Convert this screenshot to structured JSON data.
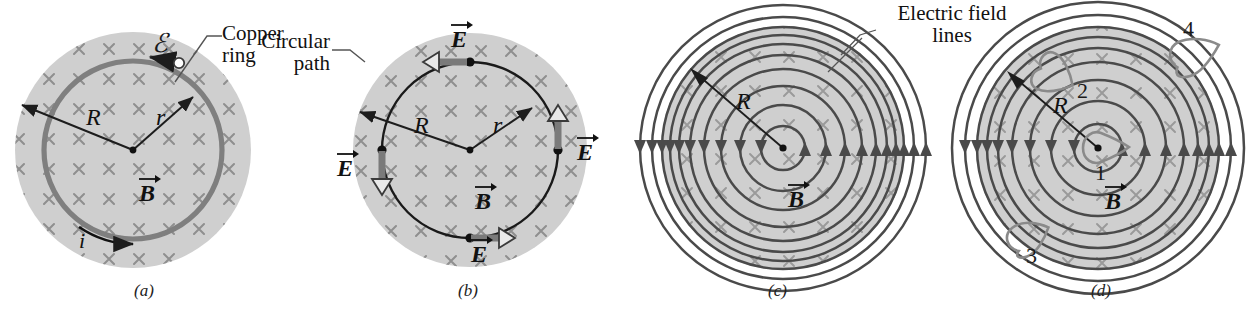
{
  "figure": {
    "background_color": "#ffffff",
    "disk_fill": "#cfcfcf",
    "cross_color": "#8c8c8c",
    "line_color": "#3b3b3b",
    "ring_color": "#808080",
    "loop_color": "#8a8a8a"
  },
  "callouts": [
    {
      "id": "copper-ring",
      "text": "Copper\nring"
    },
    {
      "id": "circular-path",
      "text": "Circular\npath"
    },
    {
      "id": "electric-field-lines",
      "text": "Electric field\nlines"
    }
  ],
  "panels": [
    {
      "id": "a",
      "letter": "(a)",
      "caption_label": "Copper ring in a uniform magnetic field into the page",
      "field_symbol": "×",
      "field_direction": "into-page",
      "labels": [
        {
          "id": "radius-R",
          "text": "R"
        },
        {
          "id": "radius-r",
          "text": "r"
        },
        {
          "id": "field-B",
          "text": "B",
          "vector": true
        },
        {
          "id": "current-i",
          "text": "i",
          "vector": false
        },
        {
          "id": "emf",
          "text": "ℰ",
          "vector": false
        }
      ],
      "elements": [
        "shaded-disk",
        "copper-ring",
        "radius-arrow-R",
        "radius-arrow-r",
        "current-arrow",
        "emf-marker"
      ]
    },
    {
      "id": "b",
      "letter": "(b)",
      "caption_label": "Circular Amperian path with tangential induced E vectors",
      "field_symbol": "×",
      "field_direction": "into-page",
      "labels": [
        {
          "id": "radius-R",
          "text": "R"
        },
        {
          "id": "radius-r",
          "text": "r"
        },
        {
          "id": "field-B",
          "text": "B",
          "vector": true
        }
      ],
      "e_vectors": [
        {
          "id": "E-top",
          "text": "E",
          "vector": true,
          "points": "left"
        },
        {
          "id": "E-right",
          "text": "E",
          "vector": true,
          "points": "up"
        },
        {
          "id": "E-bottom",
          "text": "E",
          "vector": true,
          "points": "right"
        },
        {
          "id": "E-left",
          "text": "E",
          "vector": true,
          "points": "down"
        }
      ],
      "elements": [
        "shaded-disk",
        "circular-path",
        "radius-arrow-R",
        "radius-arrow-r",
        "field-point-dots"
      ]
    },
    {
      "id": "c",
      "letter": "(c)",
      "caption_label": "Concentric electric field lines circling the changing B field",
      "field_symbol": "×",
      "field_direction": "into-page",
      "labels": [
        {
          "id": "radius-R",
          "text": "R"
        },
        {
          "id": "field-B",
          "text": "B",
          "vector": true
        }
      ],
      "field_line_count": 10,
      "circulation": "counterclockwise",
      "elements": [
        "shaded-disk",
        "field-line-circles",
        "radius-arrow-R",
        "center-dot",
        "arrowheads"
      ]
    },
    {
      "id": "d",
      "letter": "(d)",
      "caption_label": "Four numbered closed paths used to evaluate the line integral of E",
      "field_symbol": "×",
      "field_direction": "into-page",
      "labels": [
        {
          "id": "radius-R",
          "text": "R"
        },
        {
          "id": "field-B",
          "text": "B",
          "vector": true
        }
      ],
      "field_line_count": 8,
      "circulation": "counterclockwise",
      "numbered_paths": [
        {
          "id": "path-1",
          "number": "1",
          "location": "center"
        },
        {
          "id": "path-2",
          "number": "2",
          "location": "upper-left inside disk"
        },
        {
          "id": "path-3",
          "number": "3",
          "location": "lower-left on disk edge"
        },
        {
          "id": "path-4",
          "number": "4",
          "location": "upper-right outside disk"
        }
      ],
      "elements": [
        "shaded-disk",
        "field-line-circles",
        "radius-arrow-R",
        "center-dot",
        "arrowheads",
        "teardrop-paths"
      ]
    }
  ]
}
